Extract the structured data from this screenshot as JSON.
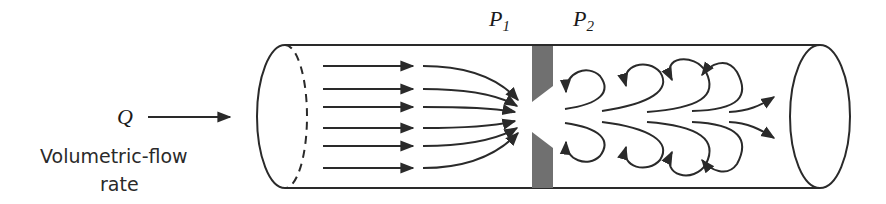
{
  "diagram": {
    "labels": {
      "flow_symbol": "Q",
      "flow_caption_line1": "Volumetric-flow",
      "flow_caption_line2": "rate",
      "pressure_upstream": "P",
      "pressure_upstream_sub": "1",
      "pressure_downstream": "P",
      "pressure_downstream_sub": "2"
    },
    "components": [
      "pipe",
      "orifice-plate",
      "inlet-streamlines",
      "converging-streamlines",
      "downstream-eddies",
      "outlet-jet"
    ],
    "colors": {
      "line": "#2a2a2a",
      "plate": "#707070",
      "background": "#ffffff"
    }
  }
}
